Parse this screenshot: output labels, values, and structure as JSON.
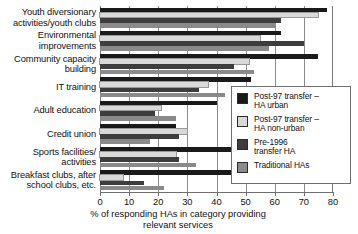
{
  "chart_data": {
    "type": "bar",
    "orientation": "horizontal",
    "title": "",
    "xlabel": "% of responding HAs in category providing relevant services",
    "ylabel": "",
    "xlim": [
      0,
      80
    ],
    "xticks": [
      0,
      10,
      20,
      30,
      40,
      50,
      60,
      70,
      80
    ],
    "grid": true,
    "legend_position": "right",
    "categories": [
      "Youth diversionary activities/youth clubs",
      "Environmental improvements",
      "Community capacity building",
      "IT training",
      "Adult education",
      "Credit union",
      "Sports facilities/ activities",
      "Breakfast clubs, after school clubs, etc."
    ],
    "series": [
      {
        "name": "Post-97 transfer – HA urban",
        "color": "#1a1a1a",
        "values": [
          78,
          62,
          75,
          52,
          40,
          26,
          48,
          45
        ]
      },
      {
        "name": "Post-97 transfer – HA non-urban",
        "color": "#d9d9d9",
        "values": [
          75,
          55,
          51,
          37,
          21,
          30,
          26,
          8
        ]
      },
      {
        "name": "Pre-1996 transfer HA",
        "color": "#3d3d3d",
        "values": [
          62,
          70,
          46,
          34,
          19,
          27,
          27,
          15
        ]
      },
      {
        "name": "Traditional HAs",
        "color": "#8a8a8a",
        "values": [
          60,
          58,
          53,
          43,
          26,
          17,
          33,
          22
        ]
      }
    ]
  },
  "axis": {
    "title_line1": "% of responding HAs in category providing",
    "title_line2": "relevant services"
  },
  "category_labels": [
    {
      "line1": "Youth diversionary",
      "line2": "activities/youth clubs"
    },
    {
      "line1": "Environmental",
      "line2": "improvements"
    },
    {
      "line1": "Community capacity",
      "line2": "building"
    },
    {
      "line1": "IT training",
      "line2": ""
    },
    {
      "line1": "Adult education",
      "line2": ""
    },
    {
      "line1": "Credit union",
      "line2": ""
    },
    {
      "line1": "Sports facilities/",
      "line2": "activities"
    },
    {
      "line1": "Breakfast clubs, after",
      "line2": "school clubs, etc."
    }
  ],
  "legend": {
    "items": [
      {
        "line1": "Post-97 transfer –",
        "line2": "HA urban",
        "color": "#1a1a1a"
      },
      {
        "line1": "Post-97 transfer –",
        "line2": "HA non-urban",
        "color": "#d9d9d9"
      },
      {
        "line1": "Pre-1996",
        "line2": "transfer HA",
        "color": "#3d3d3d"
      },
      {
        "line1": "Traditional HAs",
        "line2": "",
        "color": "#8a8a8a"
      }
    ]
  }
}
